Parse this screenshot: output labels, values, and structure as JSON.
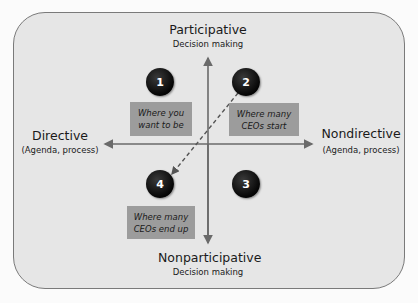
{
  "axes": {
    "top": {
      "title": "Participative",
      "subtitle": "Decision making"
    },
    "bottom": {
      "title": "Nonparticipative",
      "subtitle": "Decision making"
    },
    "left": {
      "title": "Directive",
      "subtitle": "(Agenda, process)"
    },
    "right": {
      "title": "Nondirective",
      "subtitle": "(Agenda, process)"
    }
  },
  "quadrants": [
    {
      "number": "1",
      "label_line1": "Where you",
      "label_line2": "want to be"
    },
    {
      "number": "2",
      "label_line1": "Where many",
      "label_line2": "CEOs start"
    },
    {
      "number": "3"
    },
    {
      "number": "4",
      "label_line1": "Where many",
      "label_line2": "CEOs end up"
    }
  ],
  "arrow": {
    "from": "2",
    "to": "4",
    "style": "dashed"
  },
  "colors": {
    "background": "#e6e6e6",
    "axis": "#707070",
    "label_box": "#9c9c9c",
    "circle": "#0a0a0a"
  }
}
